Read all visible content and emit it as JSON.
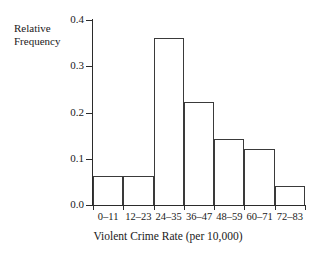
{
  "chart_data": {
    "type": "bar",
    "title": "",
    "xlabel": "Violent Crime Rate (per 10,000)",
    "ylabel": "Relative Frequency",
    "categories": [
      "0–11",
      "12–23",
      "24–35",
      "36–47",
      "48–59",
      "60–71",
      "72–83"
    ],
    "values": [
      0.062,
      0.062,
      0.362,
      0.222,
      0.142,
      0.122,
      0.042
    ],
    "ylim": [
      0.0,
      0.4
    ],
    "ytick_labels": [
      "0.0",
      "0.1",
      "0.2",
      "0.3",
      "0.4"
    ],
    "ytick_values": [
      0.0,
      0.1,
      0.2,
      0.3,
      0.4
    ],
    "grid": false,
    "legend": false,
    "bar_style": "unfilled-outline",
    "bar_edge_color": "#3a3a3a",
    "bar_fill_color": "#ffffff",
    "axis_color": "#2b2b2b"
  },
  "axis": {
    "y_title_line1": "Relative",
    "y_title_line2": "Frequency",
    "x_title": "Violent Crime Rate (per 10,000)"
  }
}
